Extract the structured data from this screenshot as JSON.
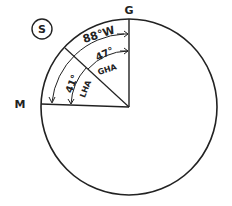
{
  "diagram": {
    "hemisphere_marker": "S",
    "points": {
      "greenwich": "G",
      "meridian": "M"
    },
    "angles": {
      "longitude": "88°W",
      "gha": "47°",
      "gha_label": "GHA",
      "lha": "41°",
      "lha_label": "LHA"
    },
    "colors": {
      "ink": "#222222",
      "background": "#ffffff"
    }
  }
}
